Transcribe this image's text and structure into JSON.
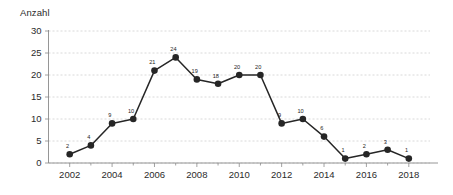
{
  "chart_data": {
    "type": "line",
    "title": "",
    "ylabel": "Anzahl",
    "xlabel": "",
    "categories": [
      2002,
      2003,
      2004,
      2005,
      2006,
      2007,
      2008,
      2009,
      2010,
      2011,
      2012,
      2013,
      2014,
      2015,
      2016,
      2017,
      2018
    ],
    "values": [
      2,
      4,
      9,
      10,
      21,
      24,
      19,
      18,
      20,
      20,
      9,
      10,
      6,
      1,
      2,
      3,
      1
    ],
    "point_labels": [
      "2",
      "4",
      "9",
      "10",
      "21",
      "24",
      "19",
      "18",
      "20",
      "20",
      "9",
      "10",
      "6",
      "1",
      "2",
      "3",
      "1"
    ],
    "ylim": [
      0,
      30
    ],
    "ytick_labels": [
      "0",
      "5",
      "10",
      "15",
      "20",
      "25",
      "30"
    ],
    "ytick_values": [
      0,
      5,
      10,
      15,
      20,
      25,
      30
    ],
    "xtick_labels": [
      "2002",
      "2004",
      "2006",
      "2008",
      "2010",
      "2012",
      "2014",
      "2016",
      "2018"
    ],
    "xtick_values": [
      2002,
      2004,
      2006,
      2008,
      2010,
      2012,
      2014,
      2016,
      2018
    ],
    "xlim": [
      2001,
      2019
    ],
    "grid": true,
    "legend": "none",
    "series_color": "#262626",
    "grid_color": "#c9c9c9",
    "axis_color": "#8a8a8a",
    "background_color": "#ffffff"
  }
}
